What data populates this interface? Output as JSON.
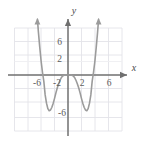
{
  "chart_data": {
    "type": "line",
    "title": "",
    "subtitle": "",
    "xlabel": "x",
    "ylabel": "y",
    "xlim": [
      -8,
      8
    ],
    "ylim": [
      -8,
      7
    ],
    "grid": true,
    "grid_step": 2,
    "legend": "none",
    "x_tick_labels": [
      "-6",
      "-2",
      "2",
      "6"
    ],
    "x_tick_values": [
      -6,
      -2,
      2,
      6
    ],
    "y_tick_labels": [
      "6",
      "2",
      "-6"
    ],
    "y_tick_values": [
      6,
      2,
      -6
    ],
    "series": [
      {
        "name": "quartic",
        "description": "W-shaped quartic curve with arrows on both upward branches",
        "x": [
          -4.55,
          -4.4,
          -4.2,
          -4.0,
          -3.8,
          -3.6,
          -3.4,
          -3.2,
          -3.0,
          -2.8,
          -2.6,
          -2.4,
          -2.2,
          -2.0,
          -1.8,
          -1.6,
          -1.4,
          -1.2,
          -1.0,
          -0.8,
          -0.6,
          -0.4,
          -0.2,
          0.0,
          0.2,
          0.4,
          0.6,
          0.8,
          1.0,
          1.2,
          1.4,
          1.6,
          1.8,
          2.0,
          2.2,
          2.4,
          2.6,
          2.8,
          3.0,
          3.2,
          3.4,
          3.6,
          3.8,
          4.0,
          4.2,
          4.4,
          4.55
        ],
        "y": [
          8.1,
          6.2,
          4.0,
          2.0,
          0.4,
          -0.9,
          -2.9,
          -4.1,
          -4.9,
          -5.2,
          -5.1,
          -4.7,
          -4.1,
          -3.4,
          -2.6,
          -1.9,
          -1.3,
          -0.8,
          -0.4,
          -0.16,
          -0.05,
          -0.01,
          0.0,
          0.0,
          0.0,
          -0.01,
          -0.05,
          -0.16,
          -0.4,
          -0.8,
          -1.3,
          -1.9,
          -2.6,
          -3.4,
          -4.1,
          -4.7,
          -5.1,
          -5.2,
          -4.9,
          -4.1,
          -2.9,
          -0.9,
          0.4,
          2.0,
          4.0,
          6.2,
          8.1
        ]
      }
    ],
    "annotations": [
      {
        "name": "left-minimum",
        "x": -3.0,
        "y": -5.2
      },
      {
        "name": "right-minimum",
        "x": 3.0,
        "y": -5.2
      },
      {
        "name": "local-maximum-origin",
        "x": 0.0,
        "y": 0.0
      },
      {
        "name": "left-branch-arrow",
        "x": -4.55,
        "y": 8.1
      },
      {
        "name": "right-branch-arrow",
        "x": 4.55,
        "y": 8.1
      }
    ],
    "colors": {
      "curve": "#9b9b9b",
      "axis": "#6f6f6f",
      "grid": "#e2e2e8",
      "background": "#ffffff",
      "tick_text": "#5d5d5d"
    }
  }
}
